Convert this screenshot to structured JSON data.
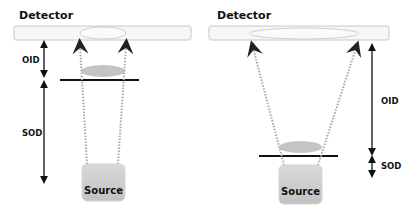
{
  "panels": [
    {
      "id": "left",
      "detector_label": "Detector",
      "oid_label": "OID",
      "sod_label": "SOD",
      "source_label": "Source"
    },
    {
      "id": "right",
      "detector_label": "Detector",
      "oid_label": "OID",
      "sod_label": "SOD",
      "source_label": "Source"
    }
  ],
  "colors": {
    "detector_fill": "#f7f7f7",
    "detector_stroke": "#c8c8c8",
    "image_ellipse_stroke": "#cfcfcf",
    "object_fill": "#c4c4c4",
    "source_fill": "#cccccc",
    "ray_color": "#a8a8a8",
    "line_color": "#111111"
  }
}
